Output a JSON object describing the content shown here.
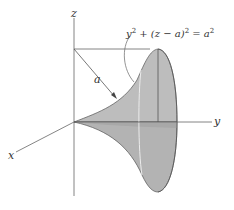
{
  "diagram": {
    "axes": {
      "x_label": "x",
      "y_label": "y",
      "z_label": "z"
    },
    "radius_label": "a",
    "equation": {
      "lhs_y": "y",
      "sup1": "2",
      "middle": " + (z − a)",
      "sup2": "2",
      "eq": " = a",
      "sup3": "2",
      "full_text": "y² + (z − a)² = a²"
    },
    "colors": {
      "surface_fill": "#bdbdbd",
      "surface_shadow": "#a9a9a9",
      "line": "#555555",
      "highlight": "#e8e8e8"
    }
  }
}
